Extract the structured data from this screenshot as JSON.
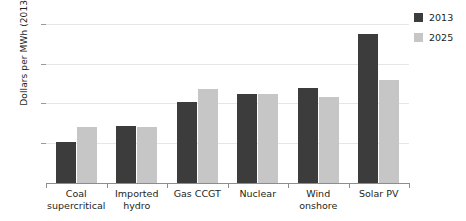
{
  "chart_data": {
    "type": "bar",
    "title": "",
    "xlabel": "",
    "ylabel": "Dollars per MWh (2013)",
    "categories": [
      "Coal supercritical",
      "Imported hydro",
      "Gas CCGT",
      "Nuclear",
      "Wind onshore",
      "Solar PV"
    ],
    "category_lines": [
      [
        "Coal",
        "supercritical"
      ],
      [
        "Imported",
        "hydro"
      ],
      [
        "Gas CCGT",
        ""
      ],
      [
        "Nuclear",
        ""
      ],
      [
        "Wind",
        "onshore"
      ],
      [
        "Solar PV",
        ""
      ]
    ],
    "series": [
      {
        "name": "2013",
        "color": "#3c3c3c",
        "values": [
          41,
          57,
          81,
          90,
          96,
          150
        ]
      },
      {
        "name": "2025",
        "color": "#c6c6c6",
        "values": [
          56,
          56,
          95,
          90,
          87,
          104
        ]
      }
    ],
    "ylim": [
      0,
      170
    ],
    "yticks": [
      40,
      80,
      120,
      160
    ],
    "ytick_labels": [
      "40",
      "80",
      "120",
      "160"
    ],
    "grid": true,
    "legend_position": "top-right",
    "legend": [
      "2013",
      "2025"
    ]
  }
}
